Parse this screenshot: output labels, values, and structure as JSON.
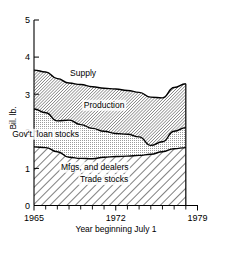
{
  "chart_data": {
    "type": "area",
    "title": "",
    "xlabel": "Year beginning July 1",
    "ylabel": "Bil. lb.",
    "xlim": [
      1965,
      1979
    ],
    "ylim": [
      0,
      5
    ],
    "ytick_labels": [
      "0",
      "1",
      "2",
      "3",
      "4",
      "5"
    ],
    "ytick_values": [
      0,
      1,
      2,
      3,
      4,
      5
    ],
    "xtick_labels": [
      "1965",
      "1972",
      "1979"
    ],
    "xtick_values": [
      1965,
      1972,
      1979
    ],
    "x_minor_ticks": [
      1966,
      1967,
      1968,
      1969,
      1970,
      1971,
      1973,
      1974,
      1975,
      1976,
      1977,
      1978
    ],
    "grid": false,
    "legend_position": "inline-annotations",
    "x": [
      1965,
      1966,
      1967,
      1968,
      1969,
      1970,
      1971,
      1972,
      1973,
      1974,
      1975,
      1976,
      1977,
      1978
    ],
    "stack_order_bottom_to_top": [
      "Mfgs, and dealers Trade stocks",
      "Gov't. loan stocks",
      "Production"
    ],
    "series": [
      {
        "name": "Mfgs, and dealers Trade stocks",
        "cumulative_top_values": [
          1.58,
          1.56,
          1.45,
          1.3,
          1.27,
          1.26,
          1.3,
          1.32,
          1.33,
          1.35,
          1.38,
          1.45,
          1.53,
          1.56
        ],
        "values": [
          1.58,
          1.56,
          1.45,
          1.3,
          1.27,
          1.26,
          1.3,
          1.32,
          1.33,
          1.35,
          1.38,
          1.45,
          1.53,
          1.56
        ]
      },
      {
        "name": "Gov't. loan stocks",
        "cumulative_top_values": [
          2.6,
          2.5,
          2.28,
          2.3,
          2.18,
          2.08,
          2.0,
          1.94,
          1.92,
          1.85,
          1.62,
          1.72,
          2.0,
          2.1
        ],
        "values": [
          1.02,
          0.94,
          0.83,
          1.0,
          0.91,
          0.82,
          0.7,
          0.62,
          0.59,
          0.5,
          0.24,
          0.27,
          0.47,
          0.54
        ]
      },
      {
        "name": "Production",
        "cumulative_top_values": [
          3.65,
          3.6,
          3.42,
          3.3,
          3.26,
          3.2,
          3.16,
          3.14,
          3.1,
          3.05,
          2.92,
          2.9,
          3.18,
          3.28
        ],
        "values": [
          1.05,
          1.1,
          1.14,
          1.0,
          1.08,
          1.12,
          1.16,
          1.2,
          1.18,
          1.2,
          1.3,
          1.18,
          1.18,
          1.18
        ]
      }
    ],
    "annotations": [
      {
        "text": "Supply",
        "x": 1969.2,
        "y": 3.48,
        "note": "labels the upper boundary of the stack"
      },
      {
        "text": "Production",
        "x": 1971.0,
        "y": 2.62
      },
      {
        "text": "Gov't. loan stocks",
        "x": 1966.0,
        "y": 1.84
      },
      {
        "text": "Mfgs, and dealers",
        "x": 1970.2,
        "y": 0.95
      },
      {
        "text": "Trade stocks",
        "x": 1971.0,
        "y": 0.62
      }
    ]
  },
  "axes": {
    "y_title": "Bil. lb.",
    "x_title": "Year beginning July 1",
    "y_ticks": [
      {
        "label": "5",
        "value": 5
      },
      {
        "label": "4",
        "value": 4
      },
      {
        "label": "3",
        "value": 3
      },
      {
        "label": "2",
        "value": 2
      },
      {
        "label": "1",
        "value": 1
      },
      {
        "label": "0",
        "value": 0
      }
    ],
    "x_ticks": [
      {
        "label": "1965",
        "value": 1965
      },
      {
        "label": "1972",
        "value": 1972
      },
      {
        "label": "1979",
        "value": 1979
      }
    ]
  },
  "labels": {
    "supply": "Supply",
    "production": "Production",
    "gov_loan_stocks": "Gov't. loan stocks",
    "mfgs_dealers": "Mfgs, and dealers",
    "trade_stocks": "Trade stocks"
  },
  "colors": {
    "ink": "#000000",
    "background": "#ffffff",
    "production_band": "#b4b4b4",
    "gov_loan_band": "#d8d8d8",
    "trade_band": "#ffffff"
  }
}
